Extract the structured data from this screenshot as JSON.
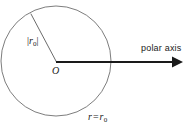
{
  "figure": {
    "type": "polar-coordinate-circle-diagram",
    "background_color": "#ffffff",
    "stroke_color": "#1a1a1a",
    "circle_stroke_color": "#6e6e6e",
    "labels": {
      "radius_magnitude_bar_open": "|",
      "radius_magnitude_symbol": "r",
      "radius_magnitude_subscript": "0",
      "radius_magnitude_bar_close": "|",
      "origin": "O",
      "polar_axis": "polar axis",
      "circle_equation_left": "r",
      "circle_equation_operator": "=",
      "circle_equation_right": "r",
      "circle_equation_subscript": "0"
    },
    "geometry": {
      "circle_center_x": 56,
      "circle_center_y": 61,
      "circle_radius": 55,
      "origin_x": 56,
      "origin_y": 62,
      "radius_line_end_x": 31,
      "radius_line_end_y": 14,
      "axis_start_x": 56,
      "axis_start_y": 62,
      "axis_tip_x": 182,
      "axis_tip_y": 62
    }
  }
}
